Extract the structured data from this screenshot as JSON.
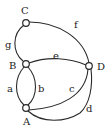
{
  "graph": {
    "nodes": [
      {
        "id": "C",
        "label": "C"
      },
      {
        "id": "B",
        "label": "B"
      },
      {
        "id": "A",
        "label": "A"
      },
      {
        "id": "D",
        "label": "D"
      }
    ],
    "edges": [
      {
        "id": "a",
        "label": "a",
        "from": "B",
        "to": "A"
      },
      {
        "id": "b",
        "label": "b",
        "from": "B",
        "to": "A"
      },
      {
        "id": "c",
        "label": "c",
        "from": "A",
        "to": "D"
      },
      {
        "id": "d",
        "label": "d",
        "from": "A",
        "to": "D"
      },
      {
        "id": "e",
        "label": "e",
        "from": "B",
        "to": "D"
      },
      {
        "id": "f",
        "label": "f",
        "from": "C",
        "to": "D"
      },
      {
        "id": "g",
        "label": "g",
        "from": "C",
        "to": "B"
      }
    ]
  }
}
